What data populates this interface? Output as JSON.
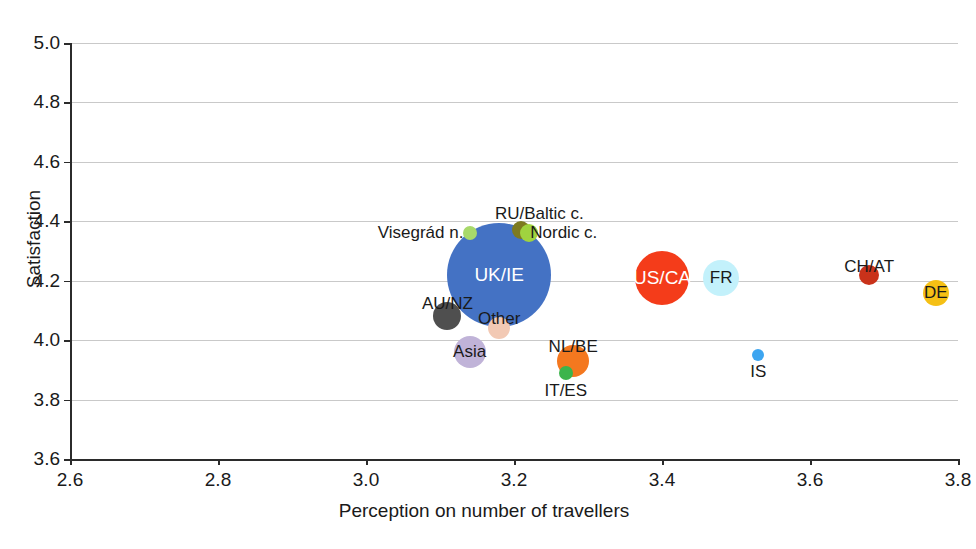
{
  "chart_data": {
    "type": "scatter",
    "title": "",
    "xlabel": "Perception on number of travellers",
    "ylabel": "Satisfaction",
    "xlim": [
      2.6,
      3.8
    ],
    "ylim": [
      3.6,
      5.0
    ],
    "xticks": [
      "2.6",
      "2.8",
      "3.0",
      "3.2",
      "3.4",
      "3.6",
      "3.8"
    ],
    "yticks": [
      "3.6",
      "3.8",
      "4.0",
      "4.2",
      "4.4",
      "4.6",
      "4.8",
      "5.0"
    ],
    "grid": true,
    "legend": "none",
    "bubbles": [
      {
        "label": "UK/IE",
        "x": 3.18,
        "y": 4.22,
        "r": 52,
        "color": "#4472c4",
        "label_pos": "inside"
      },
      {
        "label": "US/CA",
        "x": 3.4,
        "y": 4.21,
        "r": 27,
        "color": "#f43c1a",
        "label_pos": "inside"
      },
      {
        "label": "FR",
        "x": 3.48,
        "y": 4.21,
        "r": 18,
        "color": "#c3f1fb",
        "label_pos": "inside-dark"
      },
      {
        "label": "DE",
        "x": 3.77,
        "y": 4.16,
        "r": 13,
        "color": "#f5c015",
        "label_pos": "inside-dark"
      },
      {
        "label": "CH/AT",
        "x": 3.68,
        "y": 4.22,
        "r": 10,
        "color": "#c9321a",
        "label_pos": "over"
      },
      {
        "label": "Asia",
        "x": 3.14,
        "y": 3.96,
        "r": 16,
        "color": "#c0b3d8",
        "label_pos": "inside-dark"
      },
      {
        "label": "NL/BE",
        "x": 3.28,
        "y": 3.93,
        "r": 16,
        "color": "#f4781f",
        "label_pos": "over"
      },
      {
        "label": "IT/ES",
        "x": 3.27,
        "y": 3.89,
        "r": 7,
        "color": "#3cb44b",
        "label_pos": "below"
      },
      {
        "label": "AU/NZ",
        "x": 3.11,
        "y": 4.08,
        "r": 14,
        "color": "#4f4f4f",
        "label_pos": "over"
      },
      {
        "label": "Other",
        "x": 3.18,
        "y": 4.04,
        "r": 11,
        "color": "#f2c9b4",
        "label_pos": "over"
      },
      {
        "label": "IS",
        "x": 3.53,
        "y": 3.95,
        "r": 6,
        "color": "#3da5f0",
        "label_pos": "below"
      },
      {
        "label": "Visegrád n.",
        "x": 3.14,
        "y": 4.36,
        "r": 7,
        "color": "#a8d96a",
        "label_pos": "left"
      },
      {
        "label": "RU/Baltic c.",
        "x": 3.21,
        "y": 4.37,
        "r": 9,
        "color": "#7d7a20",
        "label_pos": "above"
      },
      {
        "label": "Nordic c.",
        "x": 3.22,
        "y": 4.36,
        "r": 9,
        "color": "#a0d33f",
        "label_pos": "right"
      }
    ]
  },
  "axes": {
    "x_title": "Perception on number of travellers",
    "y_title": "Satisfaction"
  }
}
